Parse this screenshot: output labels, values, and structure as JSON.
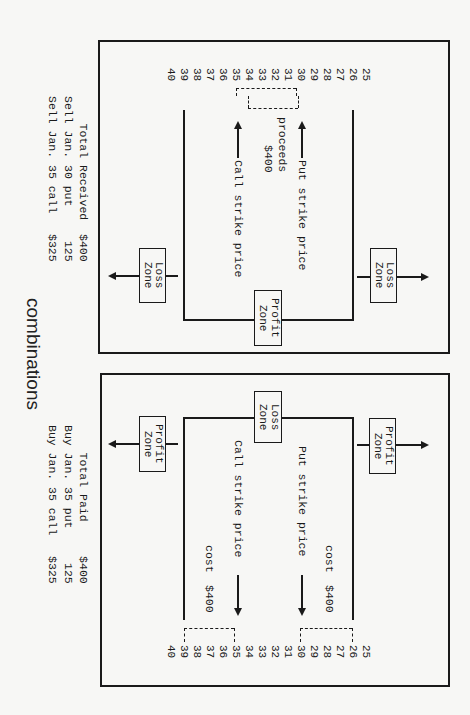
{
  "title": "combinations",
  "short_combo": {
    "header": {
      "line1": "Sell Jan. 35 call   $325",
      "line2": "Sell Jan. 30 put     125",
      "line3": "    Total Received  $400"
    },
    "price_ticks": [
      "40",
      "39",
      "38",
      "37",
      "36",
      "35",
      "34",
      "33",
      "32",
      "31",
      "30",
      "29",
      "28",
      "27",
      "26",
      "25"
    ],
    "call_label": "Call strike price",
    "put_label": "Put strike price",
    "proceeds_line1": "$400",
    "proceeds_line2": "proceeds",
    "center_zone_line1": "Profit",
    "center_zone_line2": "Zone",
    "upper_zone_line1": "Loss",
    "upper_zone_line2": "Zone",
    "lower_zone_line1": "Loss",
    "lower_zone_line2": "Zone",
    "call_strike": 35,
    "put_strike": 30,
    "upper_breakeven": 39,
    "lower_breakeven": 26
  },
  "long_combo": {
    "header": {
      "line1": "Buy Jan. 35 call   $325",
      "line2": "Buy Jan. 35 put     125",
      "line3": "    Total Paid     $400"
    },
    "price_ticks": [
      "40",
      "39",
      "38",
      "37",
      "36",
      "35",
      "34",
      "33",
      "32",
      "31",
      "30",
      "29",
      "28",
      "27",
      "26",
      "25"
    ],
    "call_label": "Call strike price",
    "put_label": "Put strike price",
    "cost_upper_line1": "$400",
    "cost_upper_line2": "cost",
    "cost_lower_line1": "$400",
    "cost_lower_line2": "cost",
    "center_zone_line1": "Loss",
    "center_zone_line2": "Zone",
    "upper_zone_line1": "Profit",
    "upper_zone_line2": "Zone",
    "lower_zone_line1": "Profit",
    "lower_zone_line2": "Zone",
    "call_strike": 35,
    "put_strike": 30,
    "upper_breakeven": 39,
    "lower_breakeven": 26
  }
}
